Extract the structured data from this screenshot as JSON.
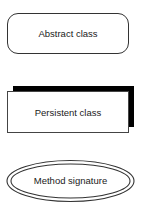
{
  "legend": {
    "items": [
      {
        "shape": "rounded-rectangle",
        "label": "Abstract class"
      },
      {
        "shape": "shadowed-rectangle",
        "label": "Persistent class"
      },
      {
        "shape": "double-ellipse",
        "label": "Method signature"
      }
    ]
  },
  "colors": {
    "stroke": "#333333",
    "shadow": "#000000",
    "background": "#ffffff"
  }
}
